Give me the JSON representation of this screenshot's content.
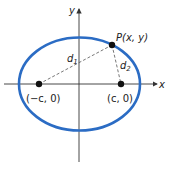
{
  "diagram": {
    "axes": {
      "x_label": "x",
      "y_label": "y"
    },
    "point": {
      "label": "P(x, y)"
    },
    "foci": [
      {
        "label": "(−c, 0)"
      },
      {
        "label": "(c, 0)"
      }
    ],
    "distances": {
      "d1": "d",
      "d1_sub": "1",
      "d2": "d",
      "d2_sub": "2"
    },
    "colors": {
      "ellipse": "#2b6cc4",
      "axis": "#333333",
      "dash": "#555555",
      "point": "#111111"
    }
  }
}
